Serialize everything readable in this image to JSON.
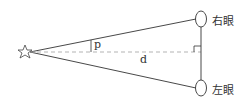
{
  "diagram": {
    "type": "parallax-geometry",
    "labels": {
      "right_eye": "右眼",
      "left_eye": "左眼",
      "angle": "p",
      "distance": "d"
    },
    "elements": {
      "object": "star",
      "eyes": [
        "right_eye",
        "left_eye"
      ],
      "baseline": "vertical line between eyes",
      "sightlines": [
        "star to right eye",
        "star to left eye"
      ],
      "perpendicular": "dashed line from star to baseline, right angle marked"
    },
    "colors": {
      "stroke": "#333333",
      "dashed": "#aaaaaa"
    }
  }
}
